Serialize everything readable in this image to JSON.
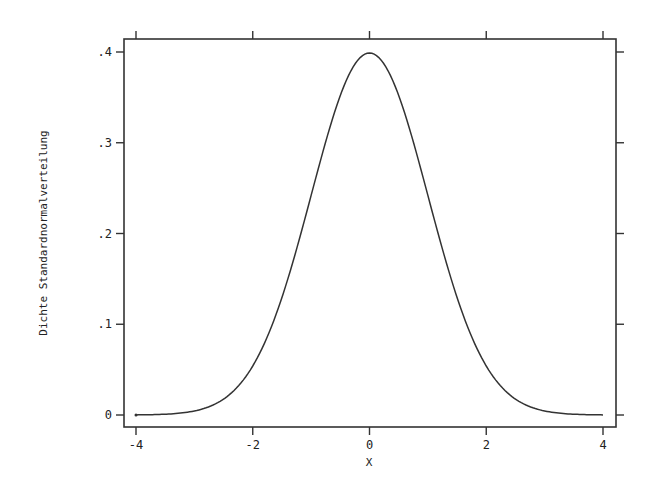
{
  "chart_data": {
    "type": "line",
    "title": "",
    "xlabel": "X",
    "ylabel": "Dichte Standardnormalverteilung",
    "xlim": [
      -4,
      4
    ],
    "ylim": [
      0,
      0.4
    ],
    "xticks": [
      -4,
      -2,
      0,
      2,
      4
    ],
    "xtick_labels": [
      "-4",
      "-2",
      "0",
      "2",
      "4"
    ],
    "yticks": [
      0,
      0.1,
      0.2,
      0.3,
      0.4
    ],
    "ytick_labels": [
      "0",
      ".1",
      ".2",
      ".3",
      ".4"
    ],
    "grid": false,
    "legend": null,
    "series": [
      {
        "name": "Dichte Standardnormalverteilung",
        "function": "standard normal density",
        "x": [
          -4,
          -3.5,
          -3,
          -2.5,
          -2,
          -1.5,
          -1,
          -0.5,
          0,
          0.5,
          1,
          1.5,
          2,
          2.5,
          3,
          3.5,
          4
        ],
        "values": [
          0.0001,
          0.0009,
          0.0044,
          0.0175,
          0.054,
          0.1295,
          0.242,
          0.3521,
          0.3989,
          0.3521,
          0.242,
          0.1295,
          0.054,
          0.0175,
          0.0044,
          0.0009,
          0.0001
        ]
      }
    ],
    "colors": {
      "line": "#333333",
      "frame": "#333333",
      "background": "#ffffff"
    }
  }
}
